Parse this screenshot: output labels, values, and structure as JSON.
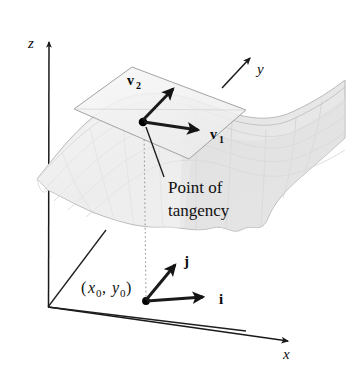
{
  "figure": {
    "background_color": "#ffffff",
    "width": 356,
    "height": 372
  },
  "axes": {
    "z_label": "z",
    "y_label": "y",
    "x_label": "x",
    "origin": {
      "x": 48,
      "y": 307
    },
    "z_tip": {
      "x": 49,
      "y": 38
    },
    "x_tip": {
      "x": 291,
      "y": 342
    },
    "y_tip": {
      "x": 252,
      "y": 56
    },
    "color": "#1a1a1a"
  },
  "surface": {
    "name": "saddle-surface",
    "fill_color": "#ebebeb",
    "edge_color": "#b8b8b8",
    "grid_color": "#c9c9c9"
  },
  "tangent_plane": {
    "name": "tangent-plane",
    "fill_color": "#f1f1f1",
    "edge_color": "#9a9a9a",
    "corners": [
      {
        "x": 74,
        "y": 109
      },
      {
        "x": 132,
        "y": 67
      },
      {
        "x": 246,
        "y": 110
      },
      {
        "x": 189,
        "y": 159
      }
    ]
  },
  "tangency_point": {
    "x": 143,
    "y": 122,
    "color": "#000000",
    "radius": 4.2
  },
  "vectors": {
    "v1": {
      "label": "v",
      "subscript": "1",
      "from": {
        "x": 143,
        "y": 122
      },
      "to": {
        "x": 203,
        "y": 131
      },
      "label_x": 212,
      "label_y": 137,
      "color": "#1a1a1a"
    },
    "v2": {
      "label": "v",
      "subscript": "2",
      "from": {
        "x": 143,
        "y": 122
      },
      "to": {
        "x": 177,
        "y": 86
      },
      "label_x": 134,
      "label_y": 84,
      "color": "#1a1a1a"
    },
    "i": {
      "label": "i",
      "from": {
        "x": 146,
        "y": 301
      },
      "to": {
        "x": 207,
        "y": 296
      },
      "label_x": 222,
      "label_y": 301,
      "color": "#1a1a1a"
    },
    "j": {
      "label": "j",
      "from": {
        "x": 146,
        "y": 301
      },
      "to": {
        "x": 178,
        "y": 262
      },
      "label_x": 186,
      "label_y": 263,
      "color": "#1a1a1a"
    }
  },
  "callout": {
    "name": "point-of-tangency-callout",
    "line1": "Point of",
    "line2": "tangency",
    "line1_x": 168,
    "line1_y": 191,
    "line2_x": 168,
    "line2_y": 214,
    "leader_from": {
      "x": 165,
      "y": 178
    },
    "leader_to": {
      "x": 145,
      "y": 126
    },
    "color": "#101010"
  },
  "base_point": {
    "name": "base-point-x0-y0",
    "x": 146,
    "y": 301,
    "label_open": "(",
    "label_x": "x",
    "label_x_sub": "0",
    "label_comma": ", ",
    "label_y": "y",
    "label_y_sub": "0",
    "label_close": ")",
    "label_left": 82,
    "label_baseline": 293,
    "dotted_line_top": {
      "x": 143,
      "y": 126
    },
    "dotted_line_bottom": {
      "x": 146,
      "y": 299
    },
    "dotted_color": "#9a9a9a"
  },
  "projection_lines": {
    "left_diagonal_from": {
      "x": 48,
      "y": 307
    },
    "left_diagonal_to": {
      "x": 104,
      "y": 232
    },
    "base_line_from": {
      "x": 48,
      "y": 307
    },
    "base_line_to": {
      "x": 243,
      "y": 330
    }
  }
}
